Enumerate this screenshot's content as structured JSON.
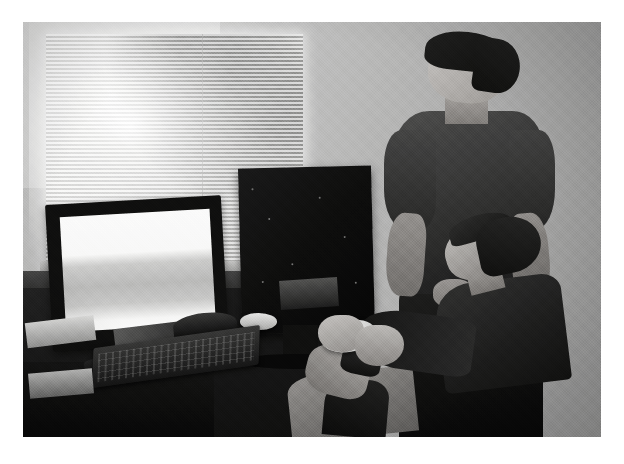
{
  "media": {
    "kind": "photograph",
    "presentation": "single photo on white page background",
    "tone": "desaturated low-contrast color, near-grayscale",
    "caption_alt": "Two men in an office: one standing in a dark t-shirt watching, one seated holding a white game controller at a desk with monitors.",
    "frame": {
      "x": 23,
      "y": 22,
      "width": 578,
      "height": 415
    }
  },
  "scene": {
    "setting_label": "office room",
    "background_label": "light gray interior wall",
    "window_label": "window with venetian blinds",
    "foliage_label": "trees visible outside window",
    "sill_label": "window sill",
    "desk_label": "dark wood desk"
  },
  "equipment": {
    "monitor_primary_label": "widescreen LCD monitor, bright screen",
    "monitor_primary_screen_label": "white screen with gray horizontal band",
    "monitor_secondary_label": "second monitor seen from behind",
    "keyboard_label": "black full-size keyboard",
    "mouse_label": "light gray computer mouse",
    "headset_label": "headset on desk",
    "paper_tray_label": "stack of papers",
    "controller_label": "white game controller"
  },
  "people": [
    {
      "id": "standing-man",
      "role_label": "standing man",
      "position_label": "right side of frame, standing",
      "hair_label": "short dark black hair",
      "clothing_top_label": "dark gray short-sleeve t-shirt",
      "clothing_bottom_label": "dark trousers",
      "pose_label": "standing with arms at sides, looking left"
    },
    {
      "id": "seated-man",
      "role_label": "seated man",
      "position_label": "lower right, seated in front of desk",
      "hair_label": "dark curly hair",
      "clothing_top_label": "dark long-sleeve shirt",
      "clothing_bottom_label": "light khaki pants",
      "pose_label": "seated holding a white game controller with both hands"
    }
  ],
  "colors": {
    "page_background": "#ffffff",
    "wall": "#bdbdba",
    "desk": "#1b1b1a",
    "screen_white": "#f6f6f2",
    "controller_white": "#f4f3ee",
    "shirt_dark": "#3b3b38",
    "skin": "#a8998a",
    "khaki": "#9a9084"
  }
}
